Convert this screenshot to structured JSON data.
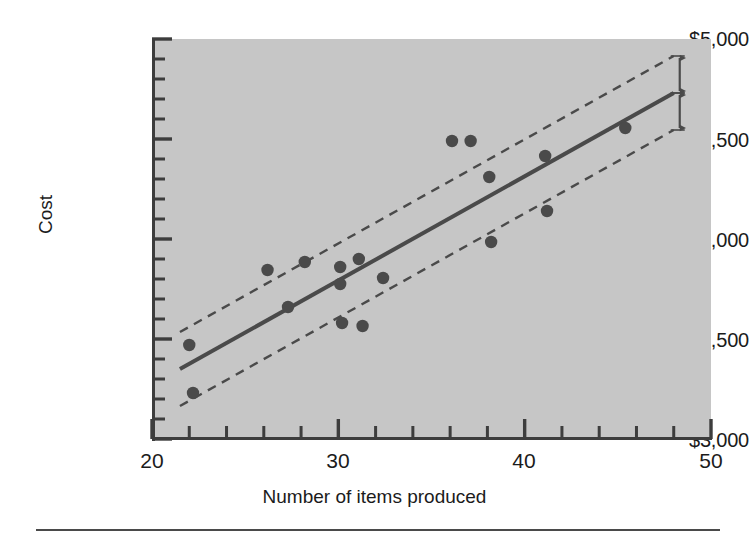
{
  "chart_data": {
    "type": "scatter",
    "title": "",
    "subtitle": "",
    "xlabel": "Number of items produced",
    "ylabel": "Cost",
    "xlim": [
      20,
      50
    ],
    "ylim": [
      3000,
      5000
    ],
    "grid": false,
    "legend": "none",
    "plot_background_color": "#c6c6c6",
    "axis_color": "#3d3d3d",
    "point_color": "#4a4a4a",
    "line_color": "#4a4a4a",
    "x_tick_labels": [
      "20",
      "30",
      "40",
      "50"
    ],
    "x_tick_values": [
      20,
      30,
      40,
      50
    ],
    "x_minor_tick_step": 2,
    "y_tick_labels": [
      "$5,000",
      "$4,500",
      "$4,000",
      "$3,500",
      "$3,000"
    ],
    "y_tick_values": [
      5000,
      4500,
      4000,
      3500,
      3000
    ],
    "y_minor_tick_step": 100,
    "series": [
      {
        "name": "observations",
        "type": "scatter",
        "points": [
          {
            "x": 22.0,
            "y": 3470
          },
          {
            "x": 22.2,
            "y": 3230
          },
          {
            "x": 26.2,
            "y": 3845
          },
          {
            "x": 27.3,
            "y": 3660
          },
          {
            "x": 28.2,
            "y": 3885
          },
          {
            "x": 30.1,
            "y": 3860
          },
          {
            "x": 30.1,
            "y": 3775
          },
          {
            "x": 30.2,
            "y": 3580
          },
          {
            "x": 31.1,
            "y": 3900
          },
          {
            "x": 31.3,
            "y": 3565
          },
          {
            "x": 32.4,
            "y": 3805
          },
          {
            "x": 36.1,
            "y": 4490
          },
          {
            "x": 37.1,
            "y": 4490
          },
          {
            "x": 38.1,
            "y": 4310
          },
          {
            "x": 38.2,
            "y": 3985
          },
          {
            "x": 41.1,
            "y": 4415
          },
          {
            "x": 41.2,
            "y": 4140
          },
          {
            "x": 45.4,
            "y": 4555
          }
        ]
      },
      {
        "name": "regression line",
        "type": "line",
        "style": "solid",
        "x": [
          21.5,
          48.0
        ],
        "y": [
          3350,
          4730
        ]
      },
      {
        "name": "upper standard error band",
        "type": "line",
        "style": "dashed",
        "x": [
          21.5,
          48.0
        ],
        "y": [
          3535,
          4915
        ]
      },
      {
        "name": "lower standard error band",
        "type": "line",
        "style": "dashed",
        "x": [
          21.5,
          48.0
        ],
        "y": [
          3165,
          4545
        ]
      }
    ],
    "annotations": [
      {
        "name": "se-upper",
        "text": "Se",
        "symbol": "S",
        "subscript": "e",
        "at_x": 48.0,
        "from_y": 4730,
        "to_y": 4915,
        "arrow": "double"
      },
      {
        "name": "se-lower",
        "text": "Se",
        "symbol": "S",
        "subscript": "e",
        "at_x": 48.0,
        "from_y": 4545,
        "to_y": 4730,
        "arrow": "double"
      }
    ]
  },
  "axes": {
    "y_title": "Cost",
    "x_title": "Number of items produced",
    "y_ticks": [
      {
        "label": "$5,000",
        "value": 5000
      },
      {
        "label": "$4,500",
        "value": 4500
      },
      {
        "label": "$4,000",
        "value": 4000
      },
      {
        "label": "$3,500",
        "value": 3500
      },
      {
        "label": "$3,000",
        "value": 3000
      }
    ],
    "x_ticks": [
      {
        "label": "20",
        "value": 20
      },
      {
        "label": "30",
        "value": 30
      },
      {
        "label": "40",
        "value": 40
      },
      {
        "label": "50",
        "value": 50
      }
    ]
  },
  "annotations": {
    "se_upper_symbol": "S",
    "se_upper_sub": "e",
    "se_lower_symbol": "S",
    "se_lower_sub": "e"
  }
}
